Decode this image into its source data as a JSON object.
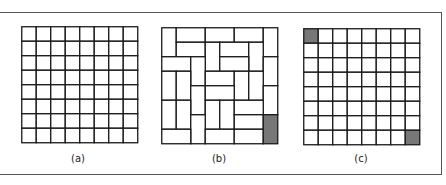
{
  "figure": {
    "panels": [
      {
        "id": "a",
        "label": "(a)",
        "rows": 8,
        "cols": 8,
        "shaded_cells": []
      },
      {
        "id": "b",
        "label": "(b)",
        "rows": 8,
        "cols": 8,
        "dominoes": [
          [
            0,
            0,
            2,
            1
          ],
          [
            0,
            1,
            1,
            2
          ],
          [
            0,
            3,
            1,
            2
          ],
          [
            0,
            5,
            1,
            2
          ],
          [
            0,
            7,
            2,
            1
          ],
          [
            1,
            1,
            1,
            2
          ],
          [
            1,
            3,
            2,
            1
          ],
          [
            1,
            4,
            1,
            2
          ],
          [
            1,
            6,
            2,
            1
          ],
          [
            2,
            0,
            1,
            2
          ],
          [
            2,
            2,
            2,
            1
          ],
          [
            2,
            4,
            1,
            2
          ],
          [
            2,
            7,
            2,
            1
          ],
          [
            3,
            0,
            2,
            1
          ],
          [
            3,
            1,
            2,
            1
          ],
          [
            3,
            3,
            1,
            2
          ],
          [
            3,
            5,
            2,
            1
          ],
          [
            3,
            6,
            2,
            1
          ],
          [
            4,
            2,
            2,
            1
          ],
          [
            4,
            3,
            1,
            2
          ],
          [
            4,
            7,
            2,
            1
          ],
          [
            5,
            0,
            2,
            1
          ],
          [
            5,
            1,
            2,
            1
          ],
          [
            5,
            3,
            2,
            1
          ],
          [
            5,
            4,
            2,
            1
          ],
          [
            5,
            5,
            1,
            2
          ],
          [
            6,
            2,
            2,
            1
          ],
          [
            6,
            5,
            1,
            2
          ],
          [
            7,
            0,
            1,
            2
          ],
          [
            7,
            3,
            1,
            2
          ],
          [
            7,
            5,
            1,
            2
          ]
        ],
        "shaded": [
          [
            6,
            7,
            2,
            1
          ]
        ]
      },
      {
        "id": "c",
        "label": "(c)",
        "rows": 8,
        "cols": 8,
        "shaded_cells": [
          [
            0,
            0
          ],
          [
            7,
            7
          ]
        ]
      }
    ],
    "colors": {
      "line": "#1a1a1a",
      "shade": "#777777",
      "frame": "#555555"
    }
  }
}
